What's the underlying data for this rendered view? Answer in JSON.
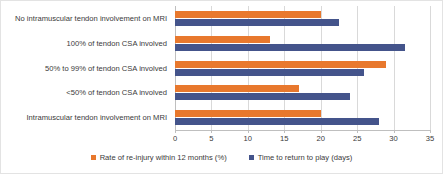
{
  "chart_data": {
    "type": "bar",
    "orientation": "horizontal",
    "title": "",
    "xlabel": "",
    "ylabel": "",
    "xlim": [
      0,
      35
    ],
    "xticks": [
      0,
      5,
      10,
      15,
      20,
      25,
      30,
      35
    ],
    "grid": true,
    "legend_position": "bottom",
    "categories": [
      "No intramuscular tendon involvement on MRI",
      "100% of tendon CSA involved",
      "50% to 99% of tendon CSA involved",
      "<50% of tendon CSA involved",
      "Intramuscular tendon involvement on MRI"
    ],
    "series": [
      {
        "name": "Rate of re-injury within 12 months (%)",
        "color": "#e8782d",
        "values": [
          20,
          13,
          29,
          17,
          20
        ]
      },
      {
        "name": "Time to return to play (days)",
        "color": "#44548b",
        "values": [
          22.5,
          31.5,
          26,
          24,
          28
        ]
      }
    ]
  },
  "legend": {
    "entries": [
      {
        "label": "Rate of re-injury within 12 months (%)"
      },
      {
        "label": "Time to return to play (days)"
      }
    ]
  }
}
